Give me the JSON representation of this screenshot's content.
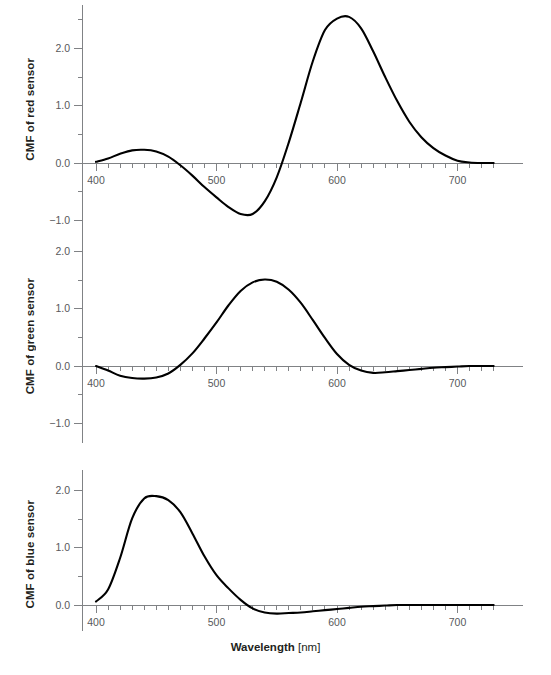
{
  "figure": {
    "xlabel_main": "Wavelength",
    "xlabel_unit": "[nm]",
    "curve_color": "#000000",
    "axis_color": "#808285",
    "background": "#ffffff"
  },
  "panels": {
    "red": {
      "ylabel": "CMF of red sensor"
    },
    "green": {
      "ylabel": "CMF of green sensor"
    },
    "blue": {
      "ylabel": "CMF of blue sensor"
    }
  },
  "axis": {
    "x_ticks": [
      "400",
      "500",
      "600",
      "700"
    ],
    "y_ticks_red": [
      "2.0",
      "1.0",
      "0.0",
      "−1.0"
    ],
    "y_ticks_green": [
      "2.0",
      "1.0",
      "0.0",
      "−1.0"
    ],
    "y_ticks_blue": [
      "2.0",
      "1.0",
      "0.0"
    ]
  },
  "chart_data": {
    "type": "line",
    "title": "",
    "subtitle": "",
    "xlabel": "Wavelength [nm]",
    "xlim": [
      390,
      730
    ],
    "x_major_ticks": [
      400,
      500,
      600,
      700
    ],
    "x_minor_tick_step": 10,
    "grid": false,
    "legend": "none",
    "panels": [
      {
        "name": "red",
        "ylabel": "CMF of red sensor",
        "ylim": [
          -1.35,
          2.75
        ],
        "y_ticks": [
          -1.0,
          0.0,
          1.0,
          2.0
        ],
        "y_minor_tick_step": 0.5,
        "peak": {
          "x": 607,
          "y": 2.55
        },
        "secondary_peak": {
          "x": 439,
          "y": 0.23
        },
        "trough": {
          "x": 524,
          "y": -0.91
        },
        "zero_crossings": [
          463,
          550
        ],
        "x": [
          400,
          410,
          420,
          430,
          440,
          450,
          460,
          470,
          480,
          490,
          500,
          510,
          520,
          530,
          540,
          550,
          560,
          570,
          580,
          590,
          600,
          610,
          620,
          630,
          640,
          650,
          660,
          670,
          680,
          690,
          700,
          710,
          720,
          730
        ],
        "y": [
          0.02,
          0.08,
          0.16,
          0.22,
          0.23,
          0.2,
          0.11,
          -0.04,
          -0.22,
          -0.42,
          -0.6,
          -0.77,
          -0.89,
          -0.89,
          -0.67,
          -0.25,
          0.36,
          1.06,
          1.78,
          2.32,
          2.52,
          2.55,
          2.35,
          1.95,
          1.5,
          1.08,
          0.72,
          0.45,
          0.26,
          0.13,
          0.04,
          0.01,
          0.0,
          0.0
        ]
      },
      {
        "name": "green",
        "ylabel": "CMF of green sensor",
        "ylim": [
          -1.35,
          2.75
        ],
        "y_ticks": [
          -1.0,
          0.0,
          1.0,
          2.0
        ],
        "y_minor_tick_step": 0.5,
        "peak": {
          "x": 542,
          "y": 1.51
        },
        "trough_blue_side": {
          "x": 438,
          "y": -0.22
        },
        "trough_red_side": {
          "x": 628,
          "y": -0.11
        },
        "zero_crossings": [
          404,
          466,
          608
        ],
        "x": [
          400,
          410,
          420,
          430,
          440,
          450,
          460,
          470,
          480,
          490,
          500,
          510,
          520,
          530,
          540,
          550,
          560,
          570,
          580,
          590,
          600,
          610,
          620,
          630,
          640,
          650,
          660,
          670,
          680,
          690,
          700,
          710,
          720,
          730
        ],
        "y": [
          0.0,
          -0.08,
          -0.17,
          -0.21,
          -0.22,
          -0.2,
          -0.13,
          0.02,
          0.22,
          0.48,
          0.76,
          1.06,
          1.31,
          1.46,
          1.51,
          1.47,
          1.33,
          1.1,
          0.8,
          0.49,
          0.21,
          0.02,
          -0.08,
          -0.12,
          -0.11,
          -0.09,
          -0.07,
          -0.05,
          -0.03,
          -0.02,
          -0.01,
          0.0,
          0.0,
          0.0
        ]
      },
      {
        "name": "blue",
        "ylabel": "CMF of blue sensor",
        "ylim": [
          -0.45,
          2.35
        ],
        "y_ticks": [
          0.0,
          1.0,
          2.0
        ],
        "y_minor_tick_step": 0.5,
        "peak": {
          "x": 447,
          "y": 1.9
        },
        "trough": {
          "x": 550,
          "y": -0.15
        },
        "zero_crossings": [
          516,
          645
        ],
        "x": [
          400,
          410,
          420,
          430,
          440,
          450,
          460,
          470,
          480,
          490,
          500,
          510,
          520,
          530,
          540,
          550,
          560,
          570,
          580,
          590,
          600,
          610,
          620,
          630,
          640,
          650,
          660,
          670,
          680,
          690,
          700,
          710,
          720,
          730
        ],
        "y": [
          0.06,
          0.27,
          0.82,
          1.51,
          1.86,
          1.9,
          1.83,
          1.62,
          1.25,
          0.85,
          0.52,
          0.29,
          0.09,
          -0.06,
          -0.13,
          -0.15,
          -0.14,
          -0.13,
          -0.11,
          -0.09,
          -0.07,
          -0.05,
          -0.03,
          -0.02,
          -0.01,
          0.0,
          0.0,
          0.0,
          0.0,
          0.0,
          0.0,
          0.0,
          0.0,
          0.0
        ]
      }
    ]
  }
}
